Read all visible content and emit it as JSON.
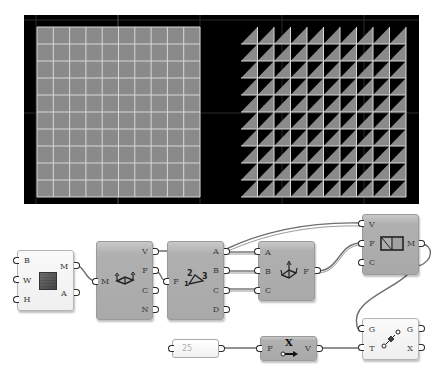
{
  "viewport": {
    "background": "#000000",
    "mesh_fill": "#8a8a8a",
    "grid_line": "#d8d8d8",
    "left_mesh": {
      "type": "quad-grid",
      "cols": 10,
      "rows": 10
    },
    "right_mesh": {
      "type": "triangulated-grid",
      "cols": 10,
      "rows": 10
    }
  },
  "components": {
    "mesh_plane": {
      "inputs": [
        "B",
        "W",
        "H"
      ],
      "outputs": [
        "M",
        "A"
      ],
      "icon": "mesh-plane-icon"
    },
    "deconstruct_mesh": {
      "inputs": [
        "M"
      ],
      "outputs": [
        "V",
        "F",
        "C",
        "N"
      ],
      "icon": "deconstruct-mesh-icon"
    },
    "deconstruct_face": {
      "inputs": [
        "F"
      ],
      "outputs": [
        "A",
        "B",
        "C",
        "D"
      ],
      "icon": "deconstruct-face-icon",
      "icon_digits": [
        "2",
        "3",
        "1"
      ]
    },
    "construct_face": {
      "inputs": [
        "A",
        "B",
        "C"
      ],
      "outputs": [
        "F"
      ],
      "icon": "construct-face-icon"
    },
    "construct_mesh": {
      "inputs": [
        "V",
        "F",
        "C"
      ],
      "outputs": [
        "M"
      ],
      "icon": "construct-mesh-icon"
    },
    "move": {
      "inputs": [
        "G",
        "T"
      ],
      "outputs": [
        "G",
        "X"
      ],
      "icon": "move-icon"
    },
    "number_panel": {
      "value": "25"
    },
    "unit_x": {
      "inputs": [
        "F"
      ],
      "outputs": [
        "V"
      ],
      "icon": "unit-x-icon",
      "icon_label": "X"
    }
  },
  "colors": {
    "wire": "#6e6e6e",
    "component_gray": "#adadad",
    "component_white": "#f3f3f3"
  }
}
